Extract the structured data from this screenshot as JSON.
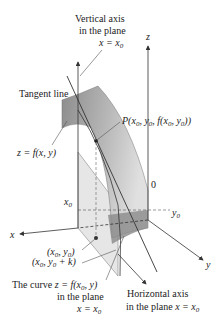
{
  "labels": {
    "vertical_axis_line1": "Vertical axis",
    "vertical_axis_line2": "in the plane",
    "vertical_axis_eq": "x = x",
    "vertical_axis_eq_sub": "0",
    "z_axis": "z",
    "tangent_line": "Tangent line",
    "point_p": "P(x",
    "point_p_full": "P(x0, y0, f(x0, y0))",
    "surface": "z = f(x, y)",
    "origin": "0",
    "x0": "x",
    "x0_sub": "0",
    "y0": "y",
    "y0_sub": "0",
    "x_axis": "x",
    "y_axis": "y",
    "point_xy": "(x0, y0)",
    "point_xyk": "(x0, y0 + k)",
    "curve_line1": "The curve z = f(x0, y)",
    "curve_line2": "in the plane",
    "curve_line3": "x = x0",
    "horiz_line1": "Horizontal axis",
    "horiz_line2": "in the plane x = x0"
  },
  "colors": {
    "surface_dark": "#8a8a8a",
    "surface_light": "#d4d4d4",
    "plane": "#e4e4e4",
    "line": "#333333",
    "point": "#222222"
  }
}
